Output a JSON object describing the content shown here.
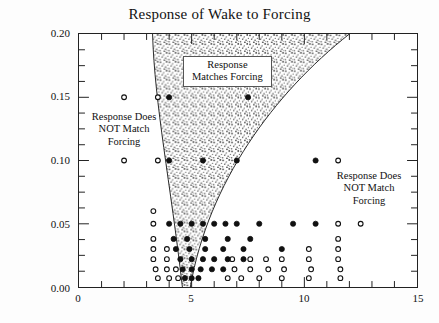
{
  "chart_data": {
    "type": "scatter",
    "title": "Response of Wake to Forcing",
    "xlabel": "",
    "ylabel": "Forcing Amplitude u' / U∞",
    "xlim": [
      0,
      15
    ],
    "ylim": [
      0,
      0.2
    ],
    "xticks": [
      0,
      5,
      10,
      15
    ],
    "xtick_labels": [
      "0",
      "5",
      "10",
      "15"
    ],
    "x_minor_step": 1,
    "yticks": [
      0.0,
      0.05,
      0.1,
      0.15,
      0.2
    ],
    "ytick_labels": [
      "0.00",
      "0.05",
      "0.10",
      "0.15",
      "0.20"
    ],
    "y_minor_step": 0.0125,
    "grid": false,
    "legend": null,
    "series": [
      {
        "name": "Response Matches Forcing",
        "marker": "filled-circle",
        "color": "#111111",
        "points": [
          [
            4.0,
            0.15
          ],
          [
            7.5,
            0.15
          ],
          [
            4.0,
            0.1
          ],
          [
            5.5,
            0.1
          ],
          [
            7.0,
            0.1
          ],
          [
            10.5,
            0.1
          ],
          [
            4.0,
            0.05
          ],
          [
            4.5,
            0.05
          ],
          [
            5.0,
            0.05
          ],
          [
            5.5,
            0.05
          ],
          [
            6.0,
            0.05
          ],
          [
            6.5,
            0.05
          ],
          [
            7.0,
            0.05
          ],
          [
            8.0,
            0.05
          ],
          [
            9.5,
            0.05
          ],
          [
            10.5,
            0.05
          ],
          [
            4.2,
            0.038
          ],
          [
            4.8,
            0.038
          ],
          [
            5.6,
            0.038
          ],
          [
            6.6,
            0.038
          ],
          [
            7.6,
            0.038
          ],
          [
            4.3,
            0.03
          ],
          [
            4.9,
            0.03
          ],
          [
            5.6,
            0.03
          ],
          [
            6.4,
            0.03
          ],
          [
            7.3,
            0.03
          ],
          [
            9.0,
            0.03
          ],
          [
            4.5,
            0.022
          ],
          [
            5.0,
            0.022
          ],
          [
            5.5,
            0.022
          ],
          [
            6.0,
            0.022
          ],
          [
            6.6,
            0.022
          ],
          [
            7.3,
            0.022
          ],
          [
            4.6,
            0.014
          ],
          [
            5.0,
            0.014
          ],
          [
            5.4,
            0.014
          ],
          [
            5.9,
            0.014
          ],
          [
            6.4,
            0.014
          ],
          [
            4.7,
            0.007
          ],
          [
            5.0,
            0.007
          ],
          [
            5.3,
            0.007
          ]
        ]
      },
      {
        "name": "Response Does NOT Match Forcing",
        "marker": "open-circle",
        "color": "#111111",
        "points": [
          [
            2.0,
            0.15
          ],
          [
            3.5,
            0.15
          ],
          [
            2.0,
            0.1
          ],
          [
            3.5,
            0.1
          ],
          [
            11.5,
            0.1
          ],
          [
            3.3,
            0.06
          ],
          [
            3.3,
            0.05
          ],
          [
            11.5,
            0.05
          ],
          [
            12.5,
            0.05
          ],
          [
            3.3,
            0.038
          ],
          [
            11.5,
            0.038
          ],
          [
            3.3,
            0.03
          ],
          [
            3.9,
            0.03
          ],
          [
            10.2,
            0.03
          ],
          [
            11.5,
            0.03
          ],
          [
            3.3,
            0.022
          ],
          [
            3.9,
            0.022
          ],
          [
            6.8,
            0.022
          ],
          [
            7.6,
            0.022
          ],
          [
            8.3,
            0.022
          ],
          [
            9.0,
            0.022
          ],
          [
            10.2,
            0.022
          ],
          [
            11.5,
            0.022
          ],
          [
            3.4,
            0.014
          ],
          [
            3.9,
            0.014
          ],
          [
            4.3,
            0.014
          ],
          [
            6.9,
            0.014
          ],
          [
            7.6,
            0.014
          ],
          [
            8.4,
            0.014
          ],
          [
            9.1,
            0.014
          ],
          [
            10.3,
            0.014
          ],
          [
            11.6,
            0.014
          ],
          [
            3.5,
            0.007
          ],
          [
            4.0,
            0.007
          ],
          [
            4.4,
            0.007
          ],
          [
            6.6,
            0.007
          ],
          [
            7.2,
            0.007
          ],
          [
            8.0,
            0.007
          ],
          [
            9.0,
            0.007
          ],
          [
            10.2,
            0.007
          ],
          [
            11.6,
            0.007
          ]
        ]
      }
    ],
    "regions": [
      {
        "name": "lock-on-tongue",
        "label": "Response Matches Forcing",
        "fill": "speckled-gray",
        "boundary_note": "V-shaped lock-on tongue, apex near (4.6, 0.00), opening to x=3.3 and x=12.0 at y=0.20"
      }
    ],
    "annotations": [
      {
        "id": "match",
        "text": "Response\nMatches Forcing",
        "x": 7.1,
        "y": 0.172,
        "boxed": true
      },
      {
        "id": "nomatch_l",
        "text": "Response Does\nNOT Match\nForcing",
        "x": 1.85,
        "y": 0.128,
        "boxed": false
      },
      {
        "id": "nomatch_r",
        "text": "Response Does\nNOT Match\nForcing",
        "x": 12.6,
        "y": 0.08,
        "boxed": false
      }
    ]
  }
}
